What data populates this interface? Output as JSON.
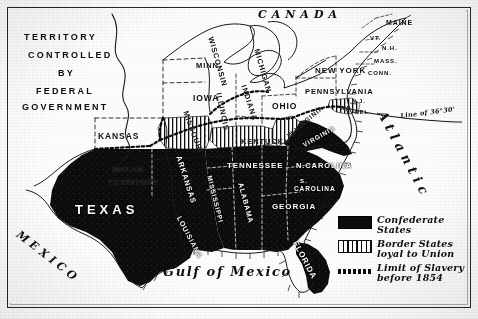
{
  "map": {
    "title": "The United States at the outbreak of the Civil War",
    "frame_color": "#2b2b2b",
    "confederate_color": "#111111",
    "union_color": "#ffffff"
  },
  "annotations": {
    "federal_territory": [
      "TERRITORY",
      "CONTROLLED",
      "BY",
      "FEDERAL",
      "GOVERNMENT"
    ],
    "canada": "CANADA",
    "mexico": "MEXICO",
    "gulf": "Gulf of Mexico",
    "atlantic": "Atlantic",
    "slavery_line": "Line of 36°30'"
  },
  "states": {
    "union_free": [
      {
        "name": "MINN.",
        "x": 196,
        "y": 62,
        "size": 7.5,
        "rot": 0
      },
      {
        "name": "IOWA",
        "x": 193,
        "y": 94,
        "size": 8.5,
        "rot": 0
      },
      {
        "name": "KANSAS",
        "x": 98,
        "y": 132,
        "size": 8.5,
        "rot": 0
      },
      {
        "name": "WISCONSIN",
        "x": 214,
        "y": 36,
        "size": 7.5,
        "rot": 74
      },
      {
        "name": "ILLINOIS",
        "x": 222,
        "y": 92,
        "size": 7.5,
        "rot": 78
      },
      {
        "name": "MICHIGAN",
        "x": 260,
        "y": 48,
        "size": 7.5,
        "rot": 74
      },
      {
        "name": "INDIANA",
        "x": 247,
        "y": 84,
        "size": 7.5,
        "rot": 72
      },
      {
        "name": "OHIO",
        "x": 272,
        "y": 102,
        "size": 8.5,
        "rot": 0
      },
      {
        "name": "PENNSYLVANIA",
        "x": 305,
        "y": 88,
        "size": 7.5,
        "rot": 0
      },
      {
        "name": "NEW YORK",
        "x": 315,
        "y": 67,
        "size": 8,
        "rot": 0
      },
      {
        "name": "MAINE",
        "x": 386,
        "y": 19,
        "size": 7,
        "rot": 0
      },
      {
        "name": "VT.",
        "x": 370,
        "y": 35,
        "size": 6,
        "rot": 0
      },
      {
        "name": "N.H.",
        "x": 382,
        "y": 45,
        "size": 6,
        "rot": 0
      },
      {
        "name": "MASS.",
        "x": 374,
        "y": 58,
        "size": 6,
        "rot": 0
      },
      {
        "name": "CONN.",
        "x": 368,
        "y": 70,
        "size": 6,
        "rot": 0
      },
      {
        "name": "N.J.",
        "x": 352,
        "y": 99,
        "size": 5.5,
        "rot": 0
      },
      {
        "name": "INDIAN",
        "x": 113,
        "y": 166,
        "size": 7.5,
        "rot": 0
      },
      {
        "name": "TERRITORY",
        "x": 108,
        "y": 179,
        "size": 7.5,
        "rot": 0
      }
    ],
    "border_states": [
      {
        "name": "MISSOURI",
        "x": 189,
        "y": 110,
        "size": 7.5,
        "rot": 70
      },
      {
        "name": "KENTUCKY",
        "x": 241,
        "y": 138,
        "size": 7.5,
        "rot": 0
      },
      {
        "name": "W.VIRGINIA",
        "x": 286,
        "y": 134,
        "size": 6.5,
        "rot": -40
      },
      {
        "name": "MD.",
        "x": 341,
        "y": 106,
        "size": 5.5,
        "rot": 0
      },
      {
        "name": "DEL.",
        "x": 355,
        "y": 110,
        "size": 5.5,
        "rot": 0
      }
    ],
    "confederate": [
      {
        "name": "TEXAS",
        "x": 75,
        "y": 203,
        "size": 13,
        "rot": 0,
        "track": 4
      },
      {
        "name": "ARKANSAS",
        "x": 182,
        "y": 155,
        "size": 7.5,
        "rot": 72
      },
      {
        "name": "LOUISIANA",
        "x": 182,
        "y": 215,
        "size": 7,
        "rot": 62
      },
      {
        "name": "MISSISSIPPI",
        "x": 212,
        "y": 175,
        "size": 6.5,
        "rot": 76
      },
      {
        "name": "TENNESSEE",
        "x": 227,
        "y": 162,
        "size": 8,
        "rot": 0
      },
      {
        "name": "ALABAMA",
        "x": 244,
        "y": 182,
        "size": 7,
        "rot": 75
      },
      {
        "name": "GEORGIA",
        "x": 272,
        "y": 203,
        "size": 8,
        "rot": 0
      },
      {
        "name": "FLORIDA",
        "x": 298,
        "y": 240,
        "size": 8,
        "rot": 62
      },
      {
        "name": "VIRGINIA",
        "x": 302,
        "y": 143,
        "size": 6.5,
        "rot": -30
      },
      {
        "name": "N.CAROLINA",
        "x": 296,
        "y": 162,
        "size": 7.5,
        "rot": 0
      },
      {
        "name": "S.",
        "x": 300,
        "y": 178,
        "size": 6,
        "rot": 0
      },
      {
        "name": "CAROLINA",
        "x": 294,
        "y": 186,
        "size": 6.5,
        "rot": 0
      }
    ]
  },
  "legend": {
    "items": [
      {
        "swatch": "solid-black",
        "label": "Confederate States"
      },
      {
        "swatch": "vertical-hatch",
        "label": "Border States loyal to Union"
      },
      {
        "swatch": "dotted-line",
        "label": "Limit of Slavery before 1854"
      }
    ]
  }
}
